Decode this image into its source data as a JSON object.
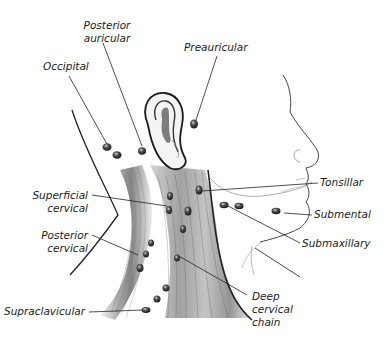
{
  "diagram": {
    "labels": {
      "posterior_auricular": {
        "line1": "Posterior",
        "line2": "auricular"
      },
      "occipital": {
        "line1": "Occipital"
      },
      "preauricular": {
        "line1": "Preauricular"
      },
      "tonsillar": {
        "line1": "Tonsillar"
      },
      "superficial_cervical": {
        "line1": "Superficial",
        "line2": "cervical"
      },
      "submental": {
        "line1": "Submental"
      },
      "posterior_cervical": {
        "line1": "Posterior",
        "line2": "cervical"
      },
      "submaxillary": {
        "line1": "Submaxillary"
      },
      "supraclavicular": {
        "line1": "Supraclavicular"
      },
      "deep_cervical_chain": {
        "line1": "Deep",
        "line2": "cervical",
        "line3": "chain"
      }
    },
    "colors": {
      "background": "#ffffff",
      "ink": "#1a1a1a",
      "node_fill": "#2b2b2b",
      "leader_line": "#222222",
      "muscle_shade": "#9a9a9a",
      "face_outline": "#555555"
    }
  }
}
